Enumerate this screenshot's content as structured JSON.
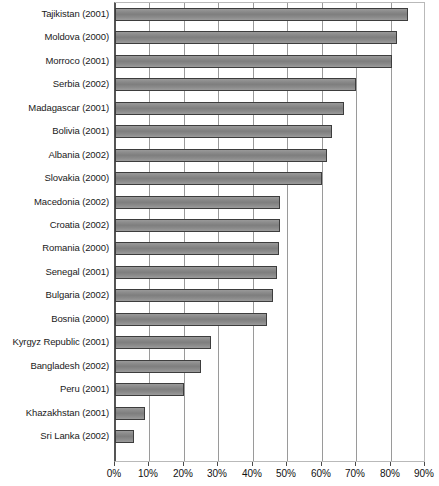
{
  "chart_data": {
    "type": "bar",
    "orientation": "horizontal",
    "title": "",
    "subtitle": "",
    "xlabel": "",
    "ylabel": "",
    "xlim": [
      0,
      90
    ],
    "grid": true,
    "legend": null,
    "xticks": [
      "0%",
      "10%",
      "20%",
      "30%",
      "40%",
      "50%",
      "60%",
      "70%",
      "80%",
      "90%"
    ],
    "xtick_values": [
      0,
      10,
      20,
      30,
      40,
      50,
      60,
      70,
      80,
      90
    ],
    "categories": [
      "Tajikistan (2001)",
      "Moldova (2000)",
      "Morroco (2001)",
      "Serbia (2002)",
      "Madagascar (2001)",
      "Bolivia (2001)",
      "Albania (2002)",
      "Slovakia (2000)",
      "Macedonia (2002)",
      "Croatia (2002)",
      "Romania (2000)",
      "Senegal (2001)",
      "Bulgaria (2002)",
      "Bosnia (2000)",
      "Kyrgyz Republic (2001)",
      "Bangladesh (2002)",
      "Peru (2001)",
      "Khazakhstan (2001)",
      "Sri Lanka (2002)"
    ],
    "values": [
      85,
      82,
      80.5,
      70,
      66.5,
      63,
      61.5,
      60,
      48,
      48,
      47.5,
      47,
      46,
      44,
      28,
      25,
      20,
      8.7,
      5.5
    ],
    "bar_color": "#8b8b8b",
    "bar_border_color": "#3d3d3d",
    "grid_color": "#9a9a9a",
    "axis_color": "#555555"
  }
}
